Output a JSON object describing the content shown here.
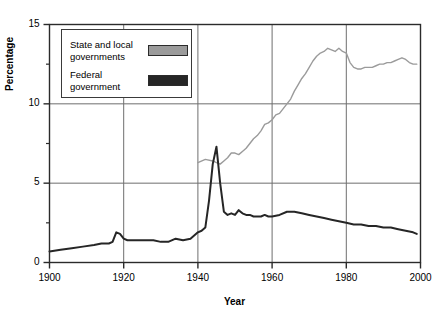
{
  "chart_data": {
    "type": "line",
    "title": "",
    "xlabel": "Year",
    "ylabel": "Percentage",
    "xlim": [
      1900,
      2000
    ],
    "ylim": [
      0,
      15
    ],
    "xticks": [
      1900,
      1920,
      1940,
      1960,
      1980,
      2000
    ],
    "yticks": [
      0,
      5,
      10,
      15
    ],
    "y_minor_ticks": [
      2.5,
      7.5,
      12.5
    ],
    "grid": true,
    "legend_position": "top-left-inside",
    "series": [
      {
        "name": "State and local governments",
        "color": "#9b9b9b",
        "x": [
          1940,
          1942,
          1944,
          1945,
          1946,
          1947,
          1948,
          1949,
          1950,
          1951,
          1952,
          1953,
          1954,
          1955,
          1956,
          1957,
          1958,
          1959,
          1960,
          1961,
          1962,
          1963,
          1964,
          1965,
          1966,
          1967,
          1968,
          1969,
          1970,
          1971,
          1972,
          1973,
          1974,
          1975,
          1976,
          1977,
          1978,
          1979,
          1980,
          1981,
          1982,
          1983,
          1984,
          1985,
          1986,
          1987,
          1988,
          1989,
          1990,
          1991,
          1992,
          1993,
          1994,
          1995,
          1996,
          1997,
          1998,
          1999
        ],
        "y": [
          6.3,
          6.5,
          6.4,
          6.3,
          6.2,
          6.4,
          6.6,
          6.9,
          6.9,
          6.8,
          7.0,
          7.2,
          7.5,
          7.8,
          8.0,
          8.3,
          8.7,
          8.8,
          9.0,
          9.3,
          9.4,
          9.7,
          10.0,
          10.3,
          10.8,
          11.2,
          11.6,
          11.9,
          12.3,
          12.7,
          13.0,
          13.2,
          13.3,
          13.5,
          13.4,
          13.3,
          13.5,
          13.3,
          13.2,
          12.6,
          12.3,
          12.2,
          12.2,
          12.3,
          12.3,
          12.3,
          12.4,
          12.5,
          12.5,
          12.6,
          12.6,
          12.7,
          12.8,
          12.9,
          12.8,
          12.6,
          12.5,
          12.5
        ]
      },
      {
        "name": "Federal government",
        "color": "#262626",
        "x": [
          1900,
          1903,
          1906,
          1909,
          1912,
          1914,
          1916,
          1917,
          1918,
          1919,
          1920,
          1921,
          1922,
          1923,
          1924,
          1926,
          1928,
          1930,
          1932,
          1934,
          1936,
          1938,
          1940,
          1941,
          1942,
          1943,
          1944,
          1945,
          1946,
          1947,
          1948,
          1949,
          1950,
          1951,
          1952,
          1953,
          1954,
          1955,
          1956,
          1957,
          1958,
          1959,
          1960,
          1962,
          1964,
          1966,
          1968,
          1970,
          1972,
          1974,
          1976,
          1978,
          1980,
          1982,
          1984,
          1986,
          1988,
          1990,
          1992,
          1994,
          1996,
          1998,
          1999
        ],
        "y": [
          0.7,
          0.8,
          0.9,
          1.0,
          1.1,
          1.2,
          1.2,
          1.3,
          1.9,
          1.8,
          1.5,
          1.4,
          1.4,
          1.4,
          1.4,
          1.4,
          1.4,
          1.3,
          1.3,
          1.5,
          1.4,
          1.5,
          1.9,
          2.0,
          2.2,
          3.9,
          6.2,
          7.3,
          5.0,
          3.2,
          3.0,
          3.1,
          3.0,
          3.3,
          3.1,
          3.0,
          3.0,
          2.9,
          2.9,
          2.9,
          3.0,
          2.9,
          2.9,
          3.0,
          3.2,
          3.2,
          3.1,
          3.0,
          2.9,
          2.8,
          2.7,
          2.6,
          2.5,
          2.4,
          2.4,
          2.3,
          2.3,
          2.2,
          2.2,
          2.1,
          2.0,
          1.9,
          1.8
        ]
      }
    ]
  },
  "legend": {
    "items": [
      {
        "label_line1": "State and local",
        "label_line2": "governments",
        "color": "#9b9b9b"
      },
      {
        "label_line1": "Federal",
        "label_line2": "government",
        "color": "#262626"
      }
    ]
  },
  "axes": {
    "y_label": "Percentage",
    "x_label": "Year",
    "y_tick_labels": [
      "0",
      "5",
      "10",
      "15"
    ],
    "x_tick_labels": [
      "1900",
      "1920",
      "1940",
      "1960",
      "1980",
      "2000"
    ]
  },
  "colors": {
    "state_local": "#9b9b9b",
    "federal": "#262626",
    "grid": "#6e6e6e",
    "axis": "#2b2b2b",
    "background": "#ffffff"
  }
}
